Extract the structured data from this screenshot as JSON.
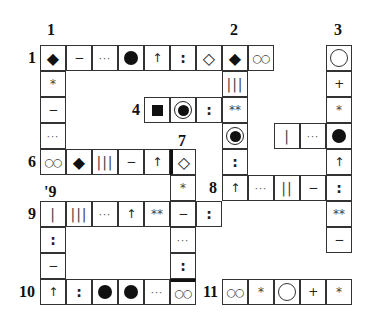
{
  "puzzle": {
    "cell_size": 26,
    "origin": {
      "x": 40,
      "y": 45
    },
    "labels": [
      {
        "text": "1",
        "x": 47,
        "y": 22,
        "ref": "down-1"
      },
      {
        "text": "2",
        "x": 230,
        "y": 22,
        "ref": "down-2"
      },
      {
        "text": "3",
        "x": 334,
        "y": 22,
        "ref": "down-3"
      },
      {
        "text": "1",
        "x": 28,
        "y": 50,
        "ref": "across-1"
      },
      {
        "text": "4",
        "x": 132,
        "y": 102,
        "ref": "across-4"
      },
      {
        "text": "5",
        "x": 288,
        "y": 128,
        "ref": "across-5"
      },
      {
        "text": "7",
        "x": 178,
        "y": 133,
        "ref": "down-7"
      },
      {
        "text": "6",
        "x": 28,
        "y": 154,
        "ref": "across-6"
      },
      {
        "text": "8",
        "x": 209,
        "y": 180,
        "ref": "across-8"
      },
      {
        "text": "'9",
        "x": 44,
        "y": 184,
        "ref": "down-9"
      },
      {
        "text": "9",
        "x": 28,
        "y": 206,
        "ref": "across-9"
      },
      {
        "text": "10",
        "x": 19,
        "y": 284,
        "ref": "across-10"
      },
      {
        "text": "11",
        "x": 203,
        "y": 284,
        "ref": "across-11"
      }
    ],
    "cells": [
      {
        "r": 0,
        "c": 0,
        "sym": "◆",
        "type": "diamond-filled",
        "name": "filled-diamond-icon"
      },
      {
        "r": 0,
        "c": 1,
        "sym": "−",
        "type": "text",
        "name": "dash-icon"
      },
      {
        "r": 0,
        "c": 2,
        "sym": "···",
        "type": "dots",
        "name": "ellipsis-icon"
      },
      {
        "r": 0,
        "c": 3,
        "sym": "",
        "type": "dot-filled",
        "name": "filled-circle-icon"
      },
      {
        "r": 0,
        "c": 4,
        "sym": "↑",
        "type": "text",
        "name": "up-arrow-icon"
      },
      {
        "r": 0,
        "c": 5,
        "sym": ":",
        "type": "colon",
        "name": "colon-icon"
      },
      {
        "r": 0,
        "c": 6,
        "sym": "◇",
        "type": "diamond-outline",
        "name": "outline-diamond-icon"
      },
      {
        "r": 0,
        "c": 7,
        "sym": "◆",
        "type": "diamond-filled",
        "name": "filled-diamond-icon"
      },
      {
        "r": 0,
        "c": 8,
        "sym": "○○",
        "type": "oo",
        "name": "double-small-circle-icon"
      },
      {
        "r": 0,
        "c": 11,
        "sym": "",
        "type": "circle",
        "name": "outline-circle-icon"
      },
      {
        "r": 1,
        "c": 0,
        "sym": "*",
        "type": "star",
        "name": "asterisk-icon"
      },
      {
        "r": 1,
        "c": 7,
        "sym": "|||",
        "type": "bars",
        "name": "triple-bar-icon"
      },
      {
        "r": 1,
        "c": 11,
        "sym": "+",
        "type": "text",
        "name": "plus-icon"
      },
      {
        "r": 2,
        "c": 0,
        "sym": "−",
        "type": "text",
        "name": "dash-icon"
      },
      {
        "r": 2,
        "c": 4,
        "sym": "",
        "type": "square",
        "name": "filled-square-icon"
      },
      {
        "r": 2,
        "c": 5,
        "sym": "",
        "type": "bullseye",
        "name": "bullseye-icon"
      },
      {
        "r": 2,
        "c": 6,
        "sym": ":",
        "type": "colon",
        "name": "colon-icon"
      },
      {
        "r": 2,
        "c": 7,
        "sym": "**",
        "type": "star",
        "name": "double-asterisk-icon"
      },
      {
        "r": 2,
        "c": 11,
        "sym": "*",
        "type": "star",
        "name": "asterisk-icon"
      },
      {
        "r": 3,
        "c": 0,
        "sym": "···",
        "type": "dots",
        "name": "ellipsis-icon"
      },
      {
        "r": 3,
        "c": 7,
        "sym": "",
        "type": "bullseye",
        "name": "bullseye-icon"
      },
      {
        "r": 3,
        "c": 9,
        "sym": "|",
        "type": "bars",
        "name": "single-bar-icon"
      },
      {
        "r": 3,
        "c": 10,
        "sym": "···",
        "type": "dots",
        "name": "ellipsis-icon"
      },
      {
        "r": 3,
        "c": 11,
        "sym": "",
        "type": "dot-filled",
        "name": "filled-circle-icon"
      },
      {
        "r": 4,
        "c": 0,
        "sym": "○○",
        "type": "oo",
        "name": "double-small-circle-icon"
      },
      {
        "r": 4,
        "c": 1,
        "sym": "◆",
        "type": "diamond-filled",
        "name": "filled-diamond-icon"
      },
      {
        "r": 4,
        "c": 2,
        "sym": "|||",
        "type": "bars",
        "name": "triple-bar-icon"
      },
      {
        "r": 4,
        "c": 3,
        "sym": "−",
        "type": "text",
        "name": "dash-icon"
      },
      {
        "r": 4,
        "c": 4,
        "sym": "↑",
        "type": "text",
        "name": "up-arrow-icon"
      },
      {
        "r": 4,
        "c": 5,
        "sym": "◇",
        "type": "diamond-outline",
        "name": "outline-diamond-icon",
        "thick": "left"
      },
      {
        "r": 4,
        "c": 7,
        "sym": ":",
        "type": "colon",
        "name": "colon-icon"
      },
      {
        "r": 4,
        "c": 11,
        "sym": "↑",
        "type": "text",
        "name": "up-arrow-icon"
      },
      {
        "r": 5,
        "c": 5,
        "sym": "*",
        "type": "star",
        "name": "asterisk-icon"
      },
      {
        "r": 5,
        "c": 7,
        "sym": "↑",
        "type": "text",
        "name": "up-arrow-icon"
      },
      {
        "r": 5,
        "c": 8,
        "sym": "···",
        "type": "dots",
        "name": "ellipsis-icon"
      },
      {
        "r": 5,
        "c": 9,
        "sym": "||",
        "type": "bars",
        "name": "double-bar-icon"
      },
      {
        "r": 5,
        "c": 10,
        "sym": "−",
        "type": "text",
        "name": "dash-icon"
      },
      {
        "r": 5,
        "c": 11,
        "sym": ":",
        "type": "colon",
        "name": "colon-icon"
      },
      {
        "r": 6,
        "c": 0,
        "sym": "|",
        "type": "bars",
        "name": "single-bar-icon"
      },
      {
        "r": 6,
        "c": 1,
        "sym": "|||",
        "type": "bars",
        "name": "triple-bar-icon"
      },
      {
        "r": 6,
        "c": 2,
        "sym": "···",
        "type": "dots",
        "name": "ellipsis-icon"
      },
      {
        "r": 6,
        "c": 3,
        "sym": "↑",
        "type": "text",
        "name": "up-arrow-icon"
      },
      {
        "r": 6,
        "c": 4,
        "sym": "**",
        "type": "star",
        "name": "double-asterisk-icon"
      },
      {
        "r": 6,
        "c": 5,
        "sym": "−",
        "type": "text",
        "name": "dash-icon"
      },
      {
        "r": 6,
        "c": 6,
        "sym": ":",
        "type": "colon",
        "name": "colon-icon"
      },
      {
        "r": 6,
        "c": 11,
        "sym": "**",
        "type": "star",
        "name": "double-asterisk-icon"
      },
      {
        "r": 7,
        "c": 0,
        "sym": ":",
        "type": "colon",
        "name": "colon-icon"
      },
      {
        "r": 7,
        "c": 5,
        "sym": "···",
        "type": "dots",
        "name": "ellipsis-icon"
      },
      {
        "r": 7,
        "c": 11,
        "sym": "−",
        "type": "text",
        "name": "dash-icon"
      },
      {
        "r": 8,
        "c": 0,
        "sym": "−",
        "type": "text",
        "name": "dash-icon"
      },
      {
        "r": 8,
        "c": 5,
        "sym": ":",
        "type": "colon",
        "name": "colon-icon"
      },
      {
        "r": 9,
        "c": 0,
        "sym": "↑",
        "type": "text",
        "name": "up-arrow-icon"
      },
      {
        "r": 9,
        "c": 1,
        "sym": ":",
        "type": "colon",
        "name": "colon-icon"
      },
      {
        "r": 9,
        "c": 2,
        "sym": "",
        "type": "dot-filled",
        "name": "filled-circle-icon"
      },
      {
        "r": 9,
        "c": 3,
        "sym": "",
        "type": "dot-filled",
        "name": "filled-circle-icon"
      },
      {
        "r": 9,
        "c": 4,
        "sym": "···",
        "type": "dots",
        "name": "ellipsis-icon"
      },
      {
        "r": 9,
        "c": 5,
        "sym": "○○",
        "type": "oo",
        "name": "double-small-circle-icon",
        "thick": "top"
      },
      {
        "r": 9,
        "c": 7,
        "sym": "○○",
        "type": "oo",
        "name": "double-small-circle-icon"
      },
      {
        "r": 9,
        "c": 8,
        "sym": "*",
        "type": "star",
        "name": "asterisk-icon"
      },
      {
        "r": 9,
        "c": 9,
        "sym": "",
        "type": "circle",
        "name": "outline-circle-icon"
      },
      {
        "r": 9,
        "c": 10,
        "sym": "+",
        "type": "text",
        "name": "plus-icon"
      },
      {
        "r": 9,
        "c": 11,
        "sym": "*",
        "type": "star",
        "name": "asterisk-icon"
      }
    ]
  }
}
